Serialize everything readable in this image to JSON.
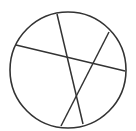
{
  "diagram": {
    "stroke_color": "#333333",
    "background": "#ffffff",
    "circle": {
      "cx": 68,
      "cy": 70,
      "r": 58
    },
    "chords": [
      {
        "x1": 57,
        "y1": 14,
        "x2": 83,
        "y2": 124
      },
      {
        "x1": 16,
        "y1": 45,
        "x2": 125,
        "y2": 71
      },
      {
        "x1": 109,
        "y1": 32,
        "x2": 61,
        "y2": 126
      }
    ]
  }
}
